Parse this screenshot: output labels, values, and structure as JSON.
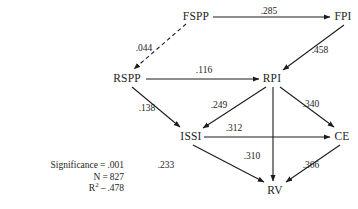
{
  "figure": {
    "type": "path-diagram",
    "background_color": "#ffffff",
    "line_color": "#1d1d1d",
    "text_color": "#1d1d1d"
  },
  "nodes": [
    {
      "id": "FSPP",
      "label": "FSPP",
      "x": 196,
      "y": 16
    },
    {
      "id": "FPI",
      "label": "FPI",
      "x": 343,
      "y": 16
    },
    {
      "id": "RSPP",
      "label": "RSPP",
      "x": 127,
      "y": 78
    },
    {
      "id": "RPI",
      "label": "RPI",
      "x": 272,
      "y": 78
    },
    {
      "id": "ISSI",
      "label": "ISSI",
      "x": 191,
      "y": 136
    },
    {
      "id": "CE",
      "label": "CE",
      "x": 342,
      "y": 136
    },
    {
      "id": "RV",
      "label": "RV",
      "x": 275,
      "y": 190
    }
  ],
  "edges": [
    {
      "from": "FSPP",
      "to": "FPI",
      "label": ".285",
      "style": "solid",
      "label_x": 269,
      "label_y": 11
    },
    {
      "from": "FSPP",
      "to": "RSPP",
      "label": ".044",
      "style": "dashed",
      "label_x": 144,
      "label_y": 48
    },
    {
      "from": "FPI",
      "to": "RPI",
      "label": ".458",
      "style": "solid",
      "label_x": 320,
      "label_y": 50
    },
    {
      "from": "RSPP",
      "to": "RPI",
      "label": ".116",
      "style": "solid",
      "label_x": 204,
      "label_y": 70
    },
    {
      "from": "RSPP",
      "to": "ISSI",
      "label": ".138",
      "style": "solid",
      "label_x": 147,
      "label_y": 108
    },
    {
      "from": "RPI",
      "to": "ISSI",
      "label": ".249",
      "style": "solid",
      "label_x": 219,
      "label_y": 105
    },
    {
      "from": "RPI",
      "to": "CE",
      "label": ".340",
      "style": "solid",
      "label_x": 311,
      "label_y": 104
    },
    {
      "from": "RPI",
      "to": "RV",
      "label": ".310",
      "style": "solid",
      "label_x": 252,
      "label_y": 156
    },
    {
      "from": "ISSI",
      "to": "CE",
      "label": ".312",
      "style": "solid",
      "label_x": 234,
      "label_y": 128
    },
    {
      "from": "ISSI",
      "to": "RV",
      "label": ".233",
      "style": "solid",
      "label_x": 166,
      "label_y": 165
    },
    {
      "from": "CE",
      "to": "RV",
      "label": ".366",
      "style": "solid",
      "label_x": 311,
      "label_y": 165
    }
  ],
  "stats": {
    "significance_label": "Significance",
    "significance_eq": "=",
    "significance_value": ".001",
    "n_label": "N",
    "n_eq": "=",
    "n_value": "827",
    "r2_label": "R",
    "r2_superscript": "2",
    "r2_eq": "–",
    "r2_value": ".478"
  }
}
